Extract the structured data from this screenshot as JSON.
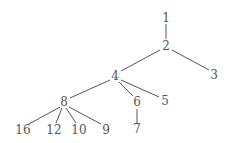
{
  "diagram": {
    "type": "tree",
    "colors": {
      "background": "#ffffff",
      "line": "#555555",
      "text": "#555555"
    },
    "nodes": [
      {
        "id": "1",
        "label": "1",
        "x": 166,
        "y": 18
      },
      {
        "id": "2",
        "label": "2",
        "x": 166,
        "y": 46
      },
      {
        "id": "3",
        "label": "3",
        "x": 214,
        "y": 75
      },
      {
        "id": "4",
        "label": "4",
        "x": 115,
        "y": 76
      },
      {
        "id": "5",
        "label": "5",
        "x": 165,
        "y": 101
      },
      {
        "id": "6",
        "label": "6",
        "x": 137,
        "y": 102
      },
      {
        "id": "7",
        "label": "7",
        "x": 137,
        "y": 129
      },
      {
        "id": "8",
        "label": "8",
        "x": 64,
        "y": 102
      },
      {
        "id": "9",
        "label": "9",
        "x": 106,
        "y": 130
      },
      {
        "id": "10",
        "label": "10",
        "x": 79,
        "y": 130
      },
      {
        "id": "12",
        "label": "12",
        "x": 54,
        "y": 130
      },
      {
        "id": "16",
        "label": "16",
        "x": 23,
        "y": 130
      }
    ],
    "edges": [
      {
        "from": "1",
        "to": "2",
        "x1": 166,
        "y1": 24,
        "x2": 166,
        "y2": 39
      },
      {
        "from": "2",
        "to": "3",
        "x1": 172,
        "y1": 50,
        "x2": 209,
        "y2": 70
      },
      {
        "from": "2",
        "to": "4",
        "x1": 160,
        "y1": 50,
        "x2": 121,
        "y2": 71
      },
      {
        "from": "4",
        "to": "8",
        "x1": 110,
        "y1": 80,
        "x2": 70,
        "y2": 98
      },
      {
        "from": "4",
        "to": "6",
        "x1": 119,
        "y1": 82,
        "x2": 133,
        "y2": 96
      },
      {
        "from": "4",
        "to": "5",
        "x1": 121,
        "y1": 80,
        "x2": 159,
        "y2": 97
      },
      {
        "from": "6",
        "to": "7",
        "x1": 137,
        "y1": 109,
        "x2": 137,
        "y2": 123
      },
      {
        "from": "8",
        "to": "16",
        "x1": 60,
        "y1": 107,
        "x2": 29,
        "y2": 124
      },
      {
        "from": "8",
        "to": "12",
        "x1": 62,
        "y1": 108,
        "x2": 56,
        "y2": 123
      },
      {
        "from": "8",
        "to": "10",
        "x1": 66,
        "y1": 108,
        "x2": 76,
        "y2": 123
      },
      {
        "from": "8",
        "to": "9",
        "x1": 69,
        "y1": 107,
        "x2": 101,
        "y2": 124
      }
    ]
  }
}
